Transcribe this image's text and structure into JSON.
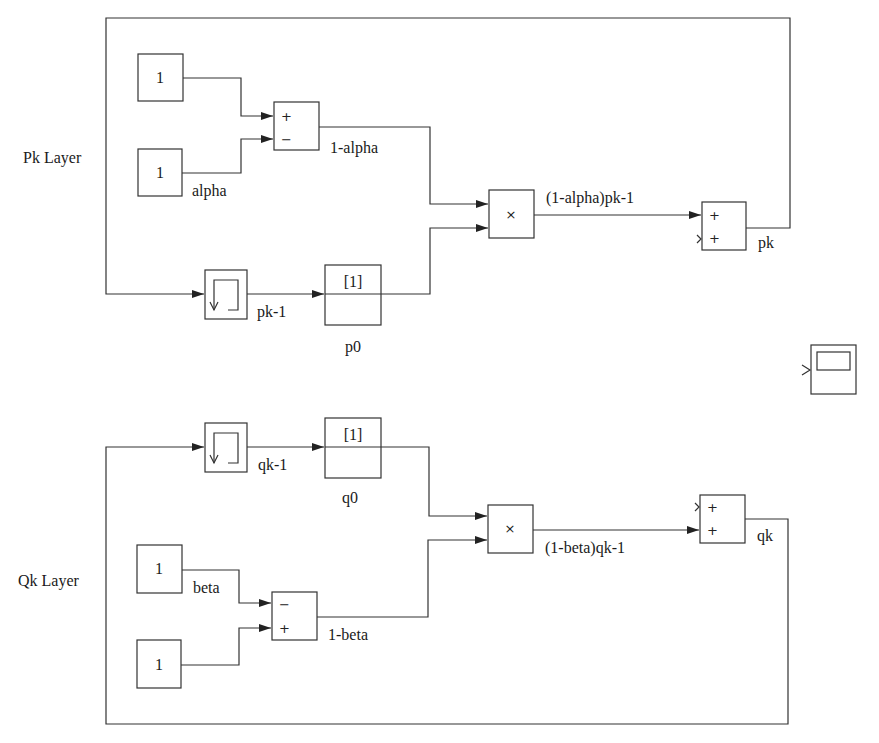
{
  "diagram": {
    "type": "simulink-block-diagram",
    "layers": {
      "pk": {
        "title": "Pk Layer",
        "const_one_value": "1",
        "const_alpha_value": "1",
        "const_alpha_label": "alpha",
        "sum_signs": [
          "+",
          "−"
        ],
        "sum_output_label": "1-alpha",
        "product_symbol": "×",
        "product_output_label": "(1-alpha)pk-1",
        "delay_output_label": "pk-1",
        "ic_value": "[1]",
        "ic_label": "p0",
        "final_sum_signs": [
          "+",
          "+"
        ],
        "final_output_label": "pk"
      },
      "qk": {
        "title": "Qk Layer",
        "const_beta_value": "1",
        "const_beta_label": "beta",
        "const_one_value": "1",
        "sum_signs": [
          "−",
          "+"
        ],
        "sum_output_label": "1-beta",
        "product_symbol": "×",
        "product_output_label": "(1-beta)qk-1",
        "delay_output_label": "qk-1",
        "ic_value": "[1]",
        "ic_label": "q0",
        "final_sum_signs": [
          "+",
          "+"
        ],
        "final_output_label": "qk"
      }
    },
    "scope": {
      "name": "scope-block"
    },
    "colors": {
      "line": "#333333",
      "background": "#ffffff",
      "text": "#1a1a1a"
    }
  }
}
